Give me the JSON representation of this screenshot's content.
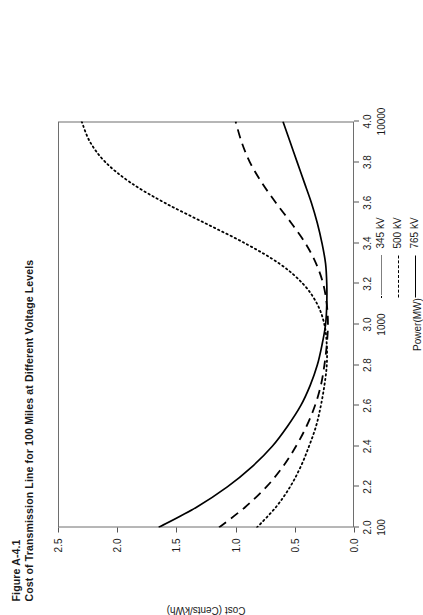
{
  "figure": {
    "number_label": "Figure A-4.1",
    "caption": "Cost of Transmission Line for 100 Miles at Different Voltage Levels"
  },
  "legend": {
    "position": "below-right",
    "entries": [
      {
        "label": "345 kV",
        "style": "dotted",
        "color": "#000000",
        "key_name": "legend-key-345kv"
      },
      {
        "label": "500 kV",
        "style": "dashed",
        "color": "#000000",
        "key_name": "legend-key-500kv"
      },
      {
        "label": "765 kV",
        "style": "solid",
        "color": "#000000",
        "key_name": "legend-key-765kv"
      }
    ]
  },
  "axes": {
    "x": {
      "title": "Power(MW)",
      "scale": "log10",
      "range": [
        2.0,
        4.0
      ],
      "major_ticks": [
        2.0,
        2.2,
        2.4,
        2.6,
        2.8,
        3.0,
        3.2,
        3.4,
        3.6,
        3.8,
        4.0
      ],
      "major_tick_labels": [
        "2.0",
        "2.2",
        "2.4",
        "2.6",
        "2.8",
        "3.0",
        "3.2",
        "3.4",
        "3.6",
        "3.8",
        "4.0"
      ],
      "decade_ticks": [
        2.0,
        3.0,
        4.0
      ],
      "decade_labels": [
        "100",
        "1000",
        "10000"
      ]
    },
    "y": {
      "title": "Cost (Cents/kWh)",
      "scale": "linear",
      "range": [
        0.0,
        2.5
      ],
      "major_ticks": [
        0.0,
        0.5,
        1.0,
        1.5,
        2.0,
        2.5
      ],
      "major_tick_labels": [
        "0.0",
        "0.5",
        "1.0",
        "1.5",
        "2.0",
        "2.5"
      ]
    },
    "grid": false
  },
  "chart_data": {
    "type": "line",
    "title": "Cost of Transmission Line for 100 Miles at Different Voltage Levels",
    "subtitle": "Figure A-4.1",
    "xlabel": "Power(MW)",
    "ylabel": "Cost (Cents/kWh)",
    "xscale": "log10",
    "xlim": [
      2.0,
      4.0
    ],
    "ylim": [
      0.0,
      2.5
    ],
    "grid": false,
    "legend_position": "below-right",
    "x": [
      2.0,
      2.1,
      2.2,
      2.3,
      2.4,
      2.5,
      2.6,
      2.7,
      2.8,
      2.9,
      3.0,
      3.1,
      3.2,
      3.3,
      3.4,
      3.5,
      3.6,
      3.7,
      3.8,
      3.9,
      4.0
    ],
    "series": [
      {
        "name": "345 kV",
        "style": "dotted",
        "color": "#000000",
        "values": [
          0.82,
          0.66,
          0.54,
          0.45,
          0.38,
          0.32,
          0.28,
          0.25,
          0.23,
          0.23,
          0.25,
          0.31,
          0.43,
          0.63,
          0.92,
          1.26,
          1.6,
          1.89,
          2.1,
          2.23,
          2.3
        ]
      },
      {
        "name": "500 kV",
        "style": "dashed",
        "color": "#000000",
        "values": [
          1.14,
          0.92,
          0.74,
          0.6,
          0.49,
          0.4,
          0.33,
          0.28,
          0.25,
          0.23,
          0.22,
          0.23,
          0.26,
          0.32,
          0.41,
          0.53,
          0.66,
          0.78,
          0.88,
          0.95,
          1.0
        ]
      },
      {
        "name": "765 kV",
        "style": "solid",
        "color": "#000000",
        "values": [
          1.65,
          1.33,
          1.07,
          0.86,
          0.69,
          0.56,
          0.45,
          0.37,
          0.31,
          0.27,
          0.24,
          0.23,
          0.23,
          0.24,
          0.27,
          0.31,
          0.36,
          0.42,
          0.48,
          0.54,
          0.6
        ]
      }
    ]
  }
}
